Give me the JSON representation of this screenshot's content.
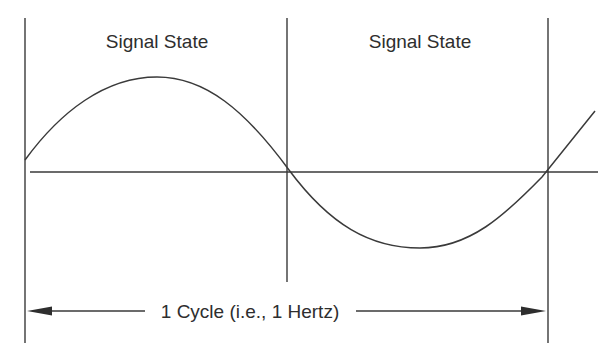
{
  "diagram": {
    "labels": {
      "state_left": "Signal State",
      "state_right": "Signal State",
      "cycle": "1 Cycle (i.e., 1 Hertz)"
    },
    "colors": {
      "line": "#3a3a3a",
      "text": "#2e2e2e",
      "background": "#ffffff"
    },
    "geometry": {
      "baseline_y": 172,
      "left_divider_x": 25,
      "middle_divider_x": 287,
      "right_divider_x": 548,
      "peak": [
        157,
        77
      ],
      "trough": [
        420,
        248
      ],
      "arrow_y": 311
    }
  }
}
